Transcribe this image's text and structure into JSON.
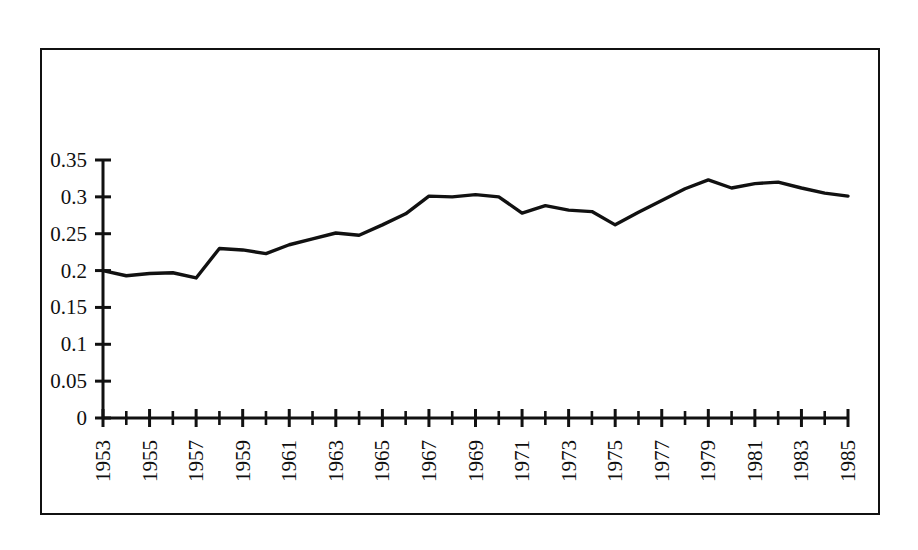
{
  "chart_data": {
    "type": "line",
    "title": "",
    "subtitle": "",
    "xlabel": "",
    "ylabel": "",
    "xlim": [
      1953,
      1985
    ],
    "ylim": [
      0,
      0.35
    ],
    "grid": false,
    "legend": null,
    "legend_position": "none",
    "y_ticks": [
      "0",
      "0.05",
      "0.1",
      "0.15",
      "0.2",
      "0.25",
      "0.3",
      "0.35"
    ],
    "y_tick_values": [
      0,
      0.05,
      0.1,
      0.15,
      0.2,
      0.25,
      0.3,
      0.35
    ],
    "x_tick_labels": [
      "1953",
      "1955",
      "1957",
      "1959",
      "1961",
      "1963",
      "1965",
      "1967",
      "1969",
      "1971",
      "1973",
      "1975",
      "1977",
      "1979",
      "1981",
      "1983",
      "1985"
    ],
    "x_tick_values": [
      1953,
      1955,
      1957,
      1959,
      1961,
      1963,
      1965,
      1967,
      1969,
      1971,
      1973,
      1975,
      1977,
      1979,
      1981,
      1983,
      1985
    ],
    "x_minor_values": [
      1954,
      1956,
      1958,
      1960,
      1962,
      1964,
      1966,
      1968,
      1970,
      1972,
      1974,
      1976,
      1978,
      1980,
      1982,
      1984
    ],
    "line_color": "#111111",
    "x": [
      1953,
      1954,
      1955,
      1956,
      1957,
      1958,
      1959,
      1960,
      1961,
      1962,
      1963,
      1964,
      1965,
      1966,
      1967,
      1968,
      1969,
      1970,
      1971,
      1972,
      1973,
      1974,
      1975,
      1976,
      1977,
      1978,
      1979,
      1980,
      1981,
      1982,
      1983,
      1984,
      1985
    ],
    "values": [
      0.2,
      0.193,
      0.196,
      0.197,
      0.19,
      0.23,
      0.228,
      0.223,
      0.235,
      0.243,
      0.251,
      0.248,
      0.262,
      0.277,
      0.301,
      0.3,
      0.303,
      0.3,
      0.278,
      0.288,
      0.282,
      0.28,
      0.262,
      0.279,
      0.295,
      0.311,
      0.323,
      0.312,
      0.318,
      0.32,
      0.312,
      0.305,
      0.301
    ],
    "series": [
      {
        "name": "series-1",
        "values": [
          0.2,
          0.193,
          0.196,
          0.197,
          0.19,
          0.23,
          0.228,
          0.223,
          0.235,
          0.243,
          0.251,
          0.248,
          0.262,
          0.277,
          0.301,
          0.3,
          0.303,
          0.3,
          0.278,
          0.288,
          0.282,
          0.28,
          0.262,
          0.279,
          0.295,
          0.311,
          0.323,
          0.312,
          0.318,
          0.32,
          0.312,
          0.305,
          0.301
        ]
      }
    ]
  }
}
